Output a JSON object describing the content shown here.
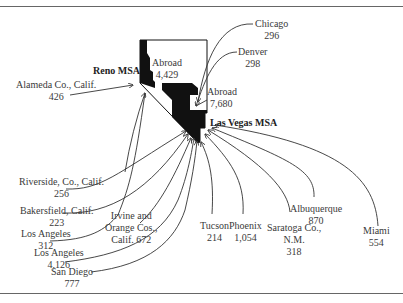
{
  "diagram": {
    "type": "migration-flow-map",
    "state": "Nevada",
    "nodes": {
      "reno": {
        "label": "Reno MSA"
      },
      "las_vegas": {
        "label": "Las Vegas MSA"
      }
    },
    "flows": [
      {
        "id": "abroad_reno",
        "name": "Abroad",
        "value": "4,429",
        "to": "Reno MSA"
      },
      {
        "id": "alameda",
        "name": "Alameda Co., Calif.",
        "value": "426",
        "to": "Reno MSA"
      },
      {
        "id": "abroad_lv",
        "name": "Abroad",
        "value": "7,680",
        "to": "Las Vegas MSA"
      },
      {
        "id": "chicago",
        "name": "Chicago",
        "value": "296",
        "to": "Las Vegas MSA"
      },
      {
        "id": "denver",
        "name": "Denver",
        "value": "298",
        "to": "Las Vegas MSA"
      },
      {
        "id": "riverside",
        "name": "Riverside, Co., Calif.",
        "value": "256",
        "to": "Las Vegas MSA"
      },
      {
        "id": "bakersfield",
        "name": "Bakersfield, Calif.",
        "value": "223",
        "to": "Las Vegas MSA"
      },
      {
        "id": "los_angeles_1",
        "name": "Los Angeles",
        "value": "312",
        "to": "Reno MSA"
      },
      {
        "id": "irvine",
        "name": "Irvine and Orange Cos., Calif.",
        "value": "672",
        "to": "Las Vegas MSA"
      },
      {
        "id": "los_angeles_2",
        "name": "Los Angeles",
        "value": "4,126",
        "to": "Las Vegas MSA"
      },
      {
        "id": "san_diego",
        "name": "San Diego",
        "value": "777",
        "to": "Las Vegas MSA"
      },
      {
        "id": "tucson",
        "name": "Tucson",
        "value": "214",
        "to": "Las Vegas MSA"
      },
      {
        "id": "phoenix",
        "name": "Phoenix",
        "value": "1,054",
        "to": "Las Vegas MSA"
      },
      {
        "id": "saratoga",
        "name": "Saratoga Co., N.M.",
        "value": "318",
        "to": "Las Vegas MSA"
      },
      {
        "id": "albuquerque",
        "name": "Albuquerque",
        "value": "870",
        "to": "Las Vegas MSA"
      },
      {
        "id": "miami",
        "name": "Miami",
        "value": "554",
        "to": "Las Vegas MSA"
      }
    ]
  },
  "labels": {
    "reno_msa": "Reno MSA",
    "las_vegas_msa": "Las Vegas MSA",
    "abroad_reno": {
      "l1": "Abroad",
      "l2": "4,429"
    },
    "abroad_lv": {
      "l1": "Abroad",
      "l2": "7,680"
    },
    "chicago": {
      "l1": "Chicago",
      "l2": "296"
    },
    "denver": {
      "l1": "Denver",
      "l2": "298"
    },
    "alameda": {
      "l1": "Alameda Co., Calif.",
      "l2": "426"
    },
    "riverside": {
      "l1": "Riverside, Co., Calif.",
      "l2": "256"
    },
    "bakersfield": {
      "l1": "Bakersfield, Calif.",
      "l2": "223"
    },
    "los_angeles_1": {
      "l1": "Los Angeles",
      "l2": "312"
    },
    "irvine": {
      "l1": "Irvine and",
      "l2": "Orange Cos.,",
      "l3": "Calif. 672"
    },
    "los_angeles_2": {
      "l1": "Los Angeles",
      "l2": "4,126"
    },
    "san_diego": {
      "l1": "San Diego",
      "l2": "777"
    },
    "tucson": {
      "l1": "Tucson",
      "l2": "214"
    },
    "phoenix": {
      "l1": "Phoenix",
      "l2": "1,054"
    },
    "saratoga": {
      "l1": "Saratoga Co.,",
      "l2": "N.M.",
      "l3": "318"
    },
    "albuquerque": {
      "l1": "Albuquerque",
      "l2": "870"
    },
    "miami": {
      "l1": "Miami",
      "l2": "554"
    }
  },
  "colors": {
    "ink": "#111111",
    "line": "#333333",
    "rule": "#666666",
    "background": "#ffffff"
  }
}
